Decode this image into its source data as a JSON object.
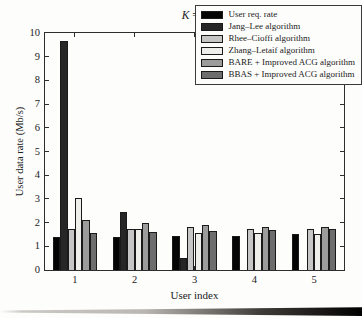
{
  "title": {
    "k": "K",
    "rest": " = 5"
  },
  "chart_data": {
    "type": "bar",
    "title": "K = 5",
    "xlabel": "User index",
    "ylabel": "User data rate (Mb/s)",
    "categories": [
      "1",
      "2",
      "3",
      "4",
      "5"
    ],
    "ylim": [
      0,
      10
    ],
    "yticks": [
      0,
      1,
      2,
      3,
      4,
      5,
      6,
      7,
      8,
      9,
      10
    ],
    "grid": false,
    "legend_position": "upper right",
    "bar_edge_color": "#1a1a1a",
    "series": [
      {
        "name": "User req. rate",
        "color": "#050505",
        "values": [
          1.4,
          1.4,
          1.45,
          1.45,
          1.5
        ]
      },
      {
        "name": "Jang–Lee algorithm",
        "color": "#262626",
        "values": [
          9.65,
          2.45,
          0.5,
          0,
          0
        ]
      },
      {
        "name": "Rhee–Cioffi algorithm",
        "color": "#c6c6c6",
        "values": [
          1.75,
          1.75,
          1.8,
          1.75,
          1.75
        ]
      },
      {
        "name": "Zhang–Letaif algorithm",
        "color": "#eeeeea",
        "values": [
          3.05,
          1.75,
          1.55,
          1.55,
          1.5
        ]
      },
      {
        "name": "BARE + Improved ACG algorithm",
        "color": "#9c9c9c",
        "values": [
          2.1,
          2.0,
          1.9,
          1.8,
          1.8
        ]
      },
      {
        "name": "BBAS + Improved ACG algorithm",
        "color": "#6d6d6d",
        "values": [
          1.55,
          1.6,
          1.65,
          1.7,
          1.75
        ]
      }
    ]
  }
}
